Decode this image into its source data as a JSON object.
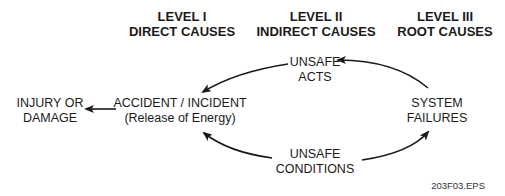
{
  "levels": [
    {
      "title": "LEVEL I",
      "subtitle": "DIRECT CAUSES"
    },
    {
      "title": "LEVEL II",
      "subtitle": "INDIRECT CAUSES"
    },
    {
      "title": "LEVEL III",
      "subtitle": "ROOT CAUSES"
    }
  ],
  "nodes": {
    "injury": {
      "line1": "INJURY OR",
      "line2": "DAMAGE"
    },
    "accident": {
      "line1": "ACCIDENT / INCIDENT",
      "line2": "(Release of Energy)"
    },
    "unsafe_acts": {
      "line1": "UNSAFE",
      "line2": "ACTS"
    },
    "unsafe_conditions": {
      "line1": "UNSAFE",
      "line2": "CONDITIONS"
    },
    "system_failures": {
      "line1": "SYSTEM",
      "line2": "FAILURES"
    }
  },
  "edges": [
    {
      "from": "system_failures",
      "to": "unsafe_acts"
    },
    {
      "from": "unsafe_acts",
      "to": "accident"
    },
    {
      "from": "unsafe_conditions",
      "to": "accident"
    },
    {
      "from": "unsafe_conditions",
      "to": "system_failures"
    },
    {
      "from": "accident",
      "to": "injury"
    }
  ],
  "figure_id": "203F03.EPS"
}
